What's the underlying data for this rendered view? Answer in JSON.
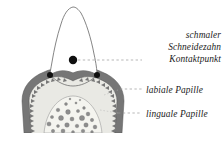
{
  "figure": {
    "kind": "anatomical-line-drawing",
    "background_color": "#ffffff"
  },
  "labels": {
    "incisor": {
      "line1": "schmaler",
      "line2": "Schneidezahn",
      "line3": "Kontaktpunkt"
    },
    "labial_papilla": "labiale Papille",
    "lingual_papilla": "linguale Papille"
  },
  "colors": {
    "outline": "#6f6f6f",
    "crown_fill": "#ffffff",
    "gingiva_band": "#767676",
    "gingiva_band_dark": "#5f5f5f",
    "submucosa_fill": "#e9e9e4",
    "inner_papilla_fill": "#f4f4ef",
    "dot_marker": "#101010",
    "speckle": "#8d8d8d",
    "leader_line": "#9a9a9a",
    "text": "#1b1b1b"
  },
  "markers": {
    "contact_point": {
      "x": 73,
      "y": 60,
      "r": 4.2
    },
    "labial_left": {
      "x": 50,
      "y": 75,
      "r": 3.0
    },
    "labial_right": {
      "x": 97,
      "y": 75,
      "r": 3.0
    }
  },
  "leaders": [
    {
      "name": "contact-point-leader",
      "x1": 78,
      "y1": 60,
      "x2": 142,
      "y2": 60
    },
    {
      "name": "labial-papilla-leader",
      "x1": 120,
      "y1": 89,
      "x2": 142,
      "y2": 89
    },
    {
      "name": "lingual-papilla-leader",
      "x1": 120,
      "y1": 113,
      "x2": 142,
      "y2": 113
    }
  ]
}
